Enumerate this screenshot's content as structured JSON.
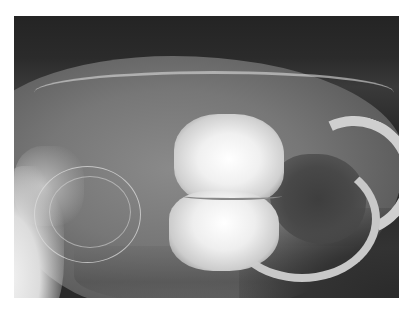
{
  "image": {
    "kind": "radiograph",
    "description": "Lateral skull radiograph of a rodent showing enlarged radiopaque cheek teeth, curved incisors, tympanic bulla rings",
    "frame": {
      "left": 14,
      "top": 16,
      "width": 385,
      "height": 282
    },
    "colors": {
      "border": "#ffffff",
      "background_dark": "#2a2a2a",
      "bone_gray": "#8a8a8a",
      "teeth_bright": "#ffffff",
      "cavity_dark": "#3e3e3e"
    }
  }
}
